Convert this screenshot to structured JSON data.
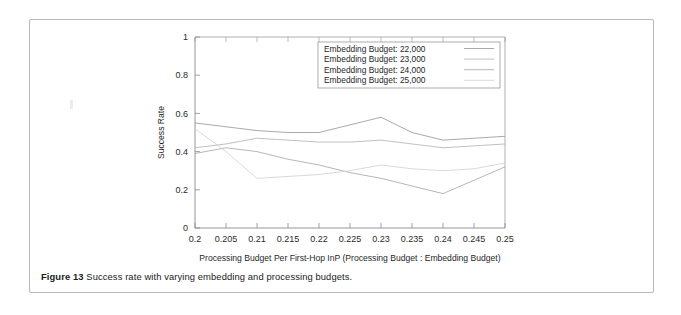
{
  "caption": {
    "label": "Figure 13",
    "text": "Success rate with varying embedding and processing budgets."
  },
  "chart_data": {
    "type": "line",
    "title": "",
    "xlabel": "Processing Budget Per First-Hop InP (Processing Budget : Embedding Budget)",
    "ylabel": "Success Rate",
    "x": [
      0.2,
      0.205,
      0.21,
      0.215,
      0.22,
      0.225,
      0.23,
      0.235,
      0.24,
      0.245,
      0.25
    ],
    "xticklabels": [
      "0.2",
      "0.205",
      "0.21",
      "0.215",
      "0.22",
      "0.225",
      "0.23",
      "0.235",
      "0.24",
      "0.245",
      "0.25"
    ],
    "yticklabels": [
      "0",
      "0.2",
      "0.4",
      "0.6",
      "0.8",
      "1"
    ],
    "yticks": [
      0,
      0.2,
      0.4,
      0.6,
      0.8,
      1
    ],
    "xlim": [
      0.2,
      0.25
    ],
    "ylim": [
      0,
      1
    ],
    "grid": false,
    "legend_position": "top-right",
    "series": [
      {
        "name": "Embedding Budget: 22,000",
        "color": "#9a9a9a",
        "values": [
          0.55,
          0.53,
          0.51,
          0.5,
          0.5,
          0.54,
          0.58,
          0.5,
          0.46,
          0.47,
          0.48
        ]
      },
      {
        "name": "Embedding Budget: 23,000",
        "color": "#b5b5b5",
        "values": [
          0.42,
          0.44,
          0.47,
          0.46,
          0.45,
          0.45,
          0.46,
          0.44,
          0.42,
          0.43,
          0.44
        ]
      },
      {
        "name": "Embedding Budget: 24,000",
        "color": "#aaaaaa",
        "values": [
          0.39,
          0.42,
          0.4,
          0.36,
          0.33,
          0.29,
          0.26,
          0.22,
          0.18,
          0.25,
          0.32
        ]
      },
      {
        "name": "Embedding Budget: 25,000",
        "color": "#d2d2d2",
        "values": [
          0.52,
          0.4,
          0.26,
          0.27,
          0.28,
          0.3,
          0.33,
          0.31,
          0.3,
          0.31,
          0.34
        ]
      }
    ]
  }
}
